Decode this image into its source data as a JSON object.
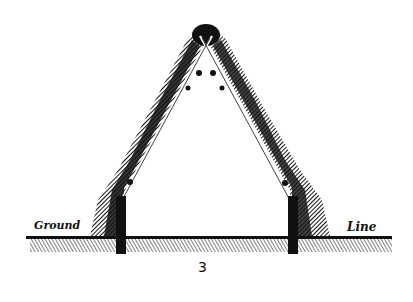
{
  "figure": {
    "type": "engraved cross-section diagram",
    "labels": {
      "left": "Ground",
      "right": "Line"
    },
    "caption": "3",
    "colors": {
      "ink": "#111111",
      "paper": "#ffffff"
    }
  }
}
